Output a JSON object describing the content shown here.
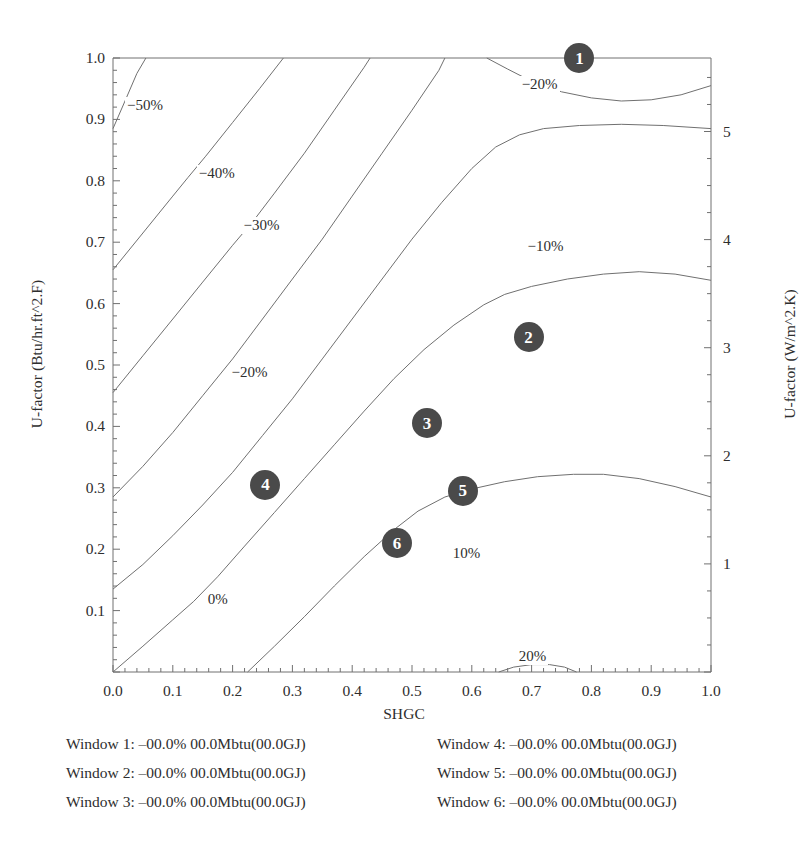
{
  "chart_data": {
    "type": "line",
    "subtype": "contour",
    "title": "",
    "xlabel": "SHGC",
    "ylabel": "U-factor (Btu/hr.ft^2.F)",
    "ylabel_right": "U-factor (W/m^2.K)",
    "xlim": [
      0.0,
      1.0
    ],
    "ylim": [
      0.0,
      1.0
    ],
    "ylim_right": [
      0.0,
      5.68
    ],
    "grid": false,
    "legend_position": "below-axes",
    "xticks": [
      "0.0",
      "0.1",
      "0.2",
      "0.3",
      "0.4",
      "0.5",
      "0.6",
      "0.7",
      "0.8",
      "0.9",
      "1.0"
    ],
    "xtick_values": [
      0.0,
      0.1,
      0.2,
      0.3,
      0.4,
      0.5,
      0.6,
      0.7,
      0.8,
      0.9,
      1.0
    ],
    "yticks": [
      "0.1",
      "0.2",
      "0.3",
      "0.4",
      "0.5",
      "0.6",
      "0.7",
      "0.8",
      "0.9",
      "1.0"
    ],
    "ytick_values": [
      0.1,
      0.2,
      0.3,
      0.4,
      0.5,
      0.6,
      0.7,
      0.8,
      0.9,
      1.0
    ],
    "yticks_right": [
      "1",
      "2",
      "3",
      "4",
      "5"
    ],
    "ytick_right_values": [
      1,
      2,
      3,
      4,
      5
    ],
    "contour_levels": [
      -50,
      -40,
      -30,
      -20,
      -10,
      0,
      10,
      20
    ],
    "contour_label_format": "%d%%",
    "contours": [
      {
        "level": "-50%",
        "label": "−50%",
        "label_xy": [
          0.02,
          0.92
        ],
        "path": [
          [
            0.0,
            0.885
          ],
          [
            0.02,
            0.93
          ],
          [
            0.04,
            0.975
          ],
          [
            0.055,
            1.0
          ]
        ]
      },
      {
        "level": "-40%",
        "label": "−40%",
        "label_xy": [
          0.14,
          0.81
        ],
        "path": [
          [
            0.0,
            0.655
          ],
          [
            0.05,
            0.715
          ],
          [
            0.1,
            0.775
          ],
          [
            0.125,
            0.805
          ],
          [
            0.155,
            0.84
          ],
          [
            0.2,
            0.895
          ],
          [
            0.245,
            0.95
          ],
          [
            0.285,
            1.0
          ]
        ]
      },
      {
        "level": "-30%",
        "label": "−30%",
        "label_xy": [
          0.215,
          0.725
        ],
        "path": [
          [
            0.0,
            0.455
          ],
          [
            0.05,
            0.515
          ],
          [
            0.1,
            0.575
          ],
          [
            0.15,
            0.635
          ],
          [
            0.2,
            0.695
          ],
          [
            0.235,
            0.735
          ],
          [
            0.27,
            0.78
          ],
          [
            0.32,
            0.845
          ],
          [
            0.37,
            0.915
          ],
          [
            0.42,
            0.985
          ],
          [
            0.43,
            1.0
          ]
        ]
      },
      {
        "level": "-20%",
        "label": "−20%",
        "label_xy": [
          0.195,
          0.485
        ],
        "path": [
          [
            0.0,
            0.285
          ],
          [
            0.05,
            0.335
          ],
          [
            0.1,
            0.39
          ],
          [
            0.15,
            0.45
          ],
          [
            0.2,
            0.51
          ],
          [
            0.25,
            0.575
          ],
          [
            0.3,
            0.64
          ],
          [
            0.35,
            0.705
          ],
          [
            0.4,
            0.775
          ],
          [
            0.45,
            0.845
          ],
          [
            0.5,
            0.915
          ],
          [
            0.545,
            0.98
          ],
          [
            0.555,
            1.0
          ]
        ]
      },
      {
        "level": "-20%",
        "label": "−20%",
        "label_xy": [
          0.68,
          0.955
        ],
        "label_only": false,
        "path": [
          [
            0.625,
            1.0
          ],
          [
            0.66,
            0.982
          ],
          [
            0.7,
            0.962
          ],
          [
            0.75,
            0.945
          ],
          [
            0.8,
            0.935
          ],
          [
            0.85,
            0.93
          ],
          [
            0.9,
            0.932
          ],
          [
            0.95,
            0.94
          ],
          [
            1.0,
            0.955
          ]
        ]
      },
      {
        "level": "-10%",
        "label": "−10%",
        "label_xy": [
          0.69,
          0.69
        ],
        "path": [
          [
            0.0,
            0.135
          ],
          [
            0.05,
            0.175
          ],
          [
            0.1,
            0.222
          ],
          [
            0.15,
            0.272
          ],
          [
            0.2,
            0.325
          ],
          [
            0.25,
            0.385
          ],
          [
            0.3,
            0.445
          ],
          [
            0.35,
            0.51
          ],
          [
            0.4,
            0.575
          ],
          [
            0.45,
            0.64
          ],
          [
            0.5,
            0.705
          ],
          [
            0.55,
            0.765
          ],
          [
            0.6,
            0.82
          ],
          [
            0.64,
            0.855
          ],
          [
            0.68,
            0.875
          ],
          [
            0.72,
            0.885
          ],
          [
            0.78,
            0.89
          ],
          [
            0.85,
            0.892
          ],
          [
            0.92,
            0.89
          ],
          [
            1.0,
            0.885
          ]
        ]
      },
      {
        "level": "0%",
        "label": "0%",
        "label_xy": [
          0.155,
          0.115
        ],
        "path": [
          [
            0.0,
            0.0
          ],
          [
            0.05,
            0.042
          ],
          [
            0.1,
            0.085
          ],
          [
            0.135,
            0.115
          ],
          [
            0.175,
            0.155
          ],
          [
            0.22,
            0.205
          ],
          [
            0.27,
            0.26
          ],
          [
            0.32,
            0.315
          ],
          [
            0.37,
            0.37
          ],
          [
            0.42,
            0.425
          ],
          [
            0.47,
            0.478
          ],
          [
            0.52,
            0.525
          ],
          [
            0.57,
            0.565
          ],
          [
            0.62,
            0.598
          ],
          [
            0.655,
            0.615
          ],
          [
            0.7,
            0.628
          ],
          [
            0.76,
            0.64
          ],
          [
            0.82,
            0.648
          ],
          [
            0.88,
            0.652
          ],
          [
            0.94,
            0.648
          ],
          [
            1.0,
            0.638
          ]
        ]
      },
      {
        "level": "10%",
        "label": "10%",
        "label_xy": [
          0.565,
          0.19
        ],
        "path": [
          [
            0.225,
            0.0
          ],
          [
            0.27,
            0.042
          ],
          [
            0.32,
            0.09
          ],
          [
            0.37,
            0.14
          ],
          [
            0.42,
            0.188
          ],
          [
            0.47,
            0.232
          ],
          [
            0.51,
            0.262
          ],
          [
            0.555,
            0.285
          ],
          [
            0.6,
            0.298
          ],
          [
            0.655,
            0.31
          ],
          [
            0.71,
            0.318
          ],
          [
            0.77,
            0.322
          ],
          [
            0.82,
            0.322
          ],
          [
            0.88,
            0.315
          ],
          [
            0.94,
            0.302
          ],
          [
            1.0,
            0.285
          ]
        ]
      },
      {
        "level": "20%",
        "label": "20%",
        "label_xy": [
          0.675,
          0.022
        ],
        "path": [
          [
            0.645,
            0.0
          ],
          [
            0.67,
            0.008
          ],
          [
            0.7,
            0.012
          ],
          [
            0.73,
            0.012
          ],
          [
            0.755,
            0.008
          ],
          [
            0.775,
            0.0
          ]
        ]
      }
    ],
    "markers": [
      {
        "id": "1",
        "label": "1",
        "shgc": 0.78,
        "u_factor": 1.0
      },
      {
        "id": "2",
        "label": "2",
        "shgc": 0.695,
        "u_factor": 0.545
      },
      {
        "id": "3",
        "label": "3",
        "shgc": 0.525,
        "u_factor": 0.405
      },
      {
        "id": "4",
        "label": "4",
        "shgc": 0.255,
        "u_factor": 0.305
      },
      {
        "id": "5",
        "label": "5",
        "shgc": 0.585,
        "u_factor": 0.295
      },
      {
        "id": "6",
        "label": "6",
        "shgc": 0.475,
        "u_factor": 0.21
      }
    ],
    "marker_color": "#4a4a4a",
    "marker_text_color": "#ffffff",
    "line_color": "#707070",
    "axis_color": "#707070"
  },
  "legend": {
    "items": [
      "Window 1: –00.0% 00.0Mbtu(00.0GJ)",
      "Window 4: –00.0% 00.0Mbtu(00.0GJ)",
      "Window 2: –00.0% 00.0Mbtu(00.0GJ)",
      "Window 5: –00.0% 00.0Mbtu(00.0GJ)",
      "Window 3: –00.0% 00.0Mbtu(00.0GJ)",
      "Window 6: –00.0% 00.0Mbtu(00.0GJ)"
    ]
  }
}
